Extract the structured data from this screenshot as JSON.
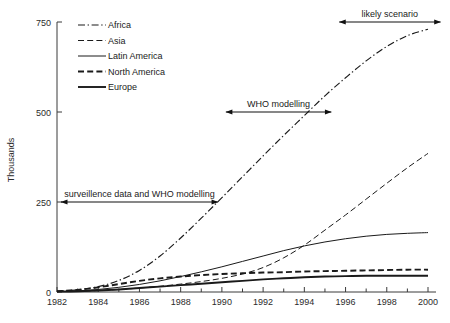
{
  "chart_data": {
    "type": "line",
    "title": "",
    "subtitle": "",
    "xlabel": "",
    "ylabel": "Thousands",
    "xlim": [
      1982,
      2000
    ],
    "ylim": [
      0,
      750
    ],
    "grid": false,
    "legend_position": "top-left",
    "x_ticks": [
      "1982",
      "1984",
      "1986",
      "1988",
      "1990",
      "1992",
      "1994",
      "1996",
      "1998",
      "2000"
    ],
    "x_tick_values": [
      1982,
      1984,
      1986,
      1988,
      1990,
      1992,
      1994,
      1996,
      1998,
      2000
    ],
    "x_minor_tick_values": [
      1983,
      1985,
      1987,
      1989,
      1991,
      1993,
      1995,
      1997,
      1999
    ],
    "y_ticks": [
      "0",
      "250",
      "500",
      "750"
    ],
    "y_tick_values": [
      0,
      250,
      500,
      750
    ],
    "x": [
      1982,
      1983,
      1984,
      1985,
      1986,
      1987,
      1988,
      1989,
      1990,
      1991,
      1992,
      1993,
      1994,
      1995,
      1996,
      1997,
      1998,
      1999,
      2000
    ],
    "series": [
      {
        "name": "Africa",
        "style": "dash-dot",
        "values": [
          2,
          6,
          15,
          32,
          60,
          100,
          150,
          205,
          262,
          320,
          378,
          435,
          490,
          545,
          595,
          642,
          682,
          712,
          730
        ]
      },
      {
        "name": "Asia",
        "style": "long-dash",
        "values": [
          1,
          2,
          4,
          7,
          11,
          16,
          22,
          29,
          38,
          50,
          68,
          95,
          130,
          172,
          214,
          258,
          302,
          345,
          385
        ]
      },
      {
        "name": "Latin America",
        "style": "solid-thin",
        "values": [
          1,
          3,
          7,
          13,
          21,
          31,
          43,
          56,
          70,
          85,
          100,
          115,
          128,
          139,
          148,
          155,
          160,
          163,
          165
        ]
      },
      {
        "name": "North America",
        "style": "dashed-thick",
        "values": [
          2,
          6,
          13,
          22,
          31,
          38,
          43,
          47,
          50,
          52,
          54,
          55,
          57,
          58,
          59,
          60,
          61,
          62,
          62
        ]
      },
      {
        "name": "Europe",
        "style": "solid-thick",
        "values": [
          1,
          2,
          4,
          7,
          11,
          15,
          19,
          23,
          27,
          31,
          35,
          38,
          41,
          43,
          44,
          45,
          45,
          45,
          45
        ]
      }
    ],
    "annotations": [
      {
        "label": "surveillence data and WHO modelling",
        "x_start": 1982,
        "x_end": 1990,
        "y": 250
      },
      {
        "label": "WHO modelling",
        "x_start": 1990,
        "x_end": 1995.5,
        "y": 500
      },
      {
        "label": "likely scenario",
        "x_start": 1995.5,
        "x_end": 2000.8,
        "y": 750
      }
    ]
  },
  "legend": {
    "items": [
      {
        "label": "Africa"
      },
      {
        "label": "Asia"
      },
      {
        "label": "Latin America"
      },
      {
        "label": "North America"
      },
      {
        "label": "Europe"
      }
    ]
  },
  "colors": {
    "ink": "#1a1a1a",
    "axis": "#3a3a3a",
    "background": "#ffffff"
  }
}
